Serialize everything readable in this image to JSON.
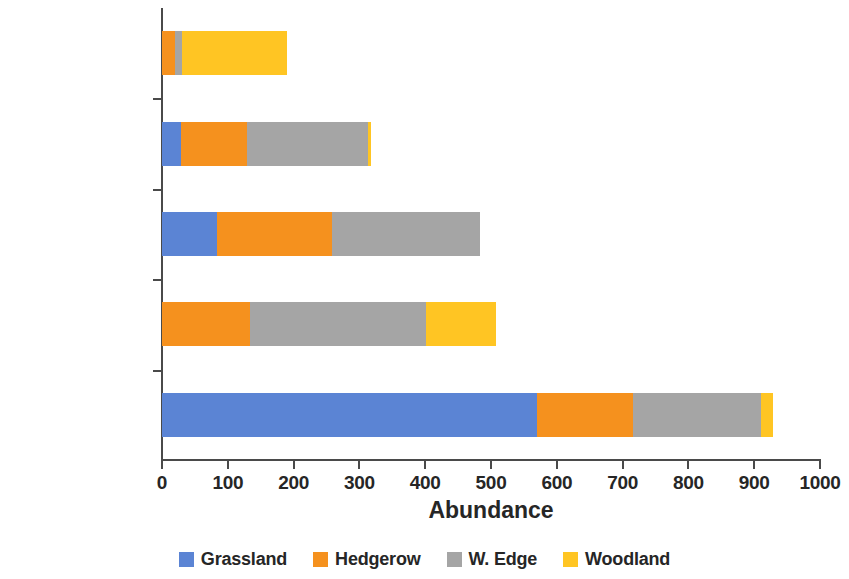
{
  "chart_data": {
    "type": "bar",
    "orientation": "horizontal",
    "stacked": true,
    "title": "",
    "xlabel": "Abundance",
    "ylabel": "",
    "xlim": [
      0,
      1000
    ],
    "xticks": [
      0,
      100,
      200,
      300,
      400,
      500,
      600,
      700,
      800,
      900,
      1000
    ],
    "grid": false,
    "legend_position": "bottom",
    "categories": [
      "Meadow Brown",
      "Ringlet",
      "Skippers",
      "Gatekeeper",
      "Speckled Wood"
    ],
    "series": [
      {
        "name": "Grassland",
        "color": "#5B84D4",
        "values": [
          570,
          0,
          84,
          29,
          0
        ]
      },
      {
        "name": "Hedgerow",
        "color": "#F5911E",
        "values": [
          146,
          134,
          174,
          100,
          20
        ]
      },
      {
        "name": "W. Edge",
        "color": "#A5A5A5",
        "values": [
          194,
          267,
          225,
          184,
          10
        ]
      },
      {
        "name": "Woodland",
        "color": "#FFC523",
        "values": [
          18,
          106,
          0,
          5,
          160
        ]
      }
    ],
    "totals": [
      928,
      507,
      483,
      318,
      190
    ]
  },
  "axis": {
    "x_title": "Abundance",
    "tick_labels": [
      "0",
      "100",
      "200",
      "300",
      "400",
      "500",
      "600",
      "700",
      "800",
      "900",
      "1000"
    ],
    "category_labels": [
      "Meadow Brown",
      "Ringlet",
      "Skippers",
      "Gatekeeper",
      "Speckled Wood"
    ]
  },
  "legend": {
    "items": [
      {
        "label": "Grassland",
        "color": "#5B84D4"
      },
      {
        "label": "Hedgerow",
        "color": "#F5911E"
      },
      {
        "label": "W. Edge",
        "color": "#A5A5A5"
      },
      {
        "label": "Woodland",
        "color": "#FFC523"
      }
    ]
  }
}
